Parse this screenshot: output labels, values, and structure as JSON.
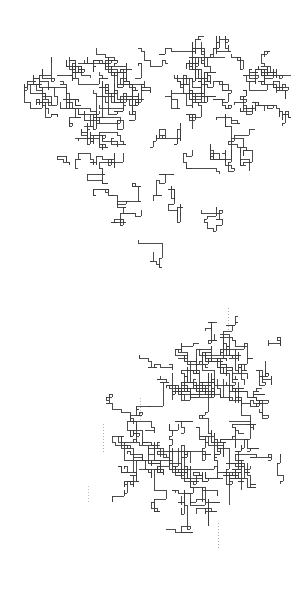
{
  "figure": {
    "title": "",
    "background_color": "#ffffff",
    "width": 298,
    "height": 607,
    "panel_count": 2
  },
  "chart_data": {
    "type": "scatter",
    "title": "",
    "subtitle": "",
    "xlabel": "",
    "ylabel": "",
    "grid": false,
    "legend": null,
    "panels": [
      {
        "id": "panel-top",
        "name": "upper-cluster",
        "x": 0,
        "y": 0,
        "width": 298,
        "height": 303,
        "stroke_color": "#3a3a3a",
        "stroke_width": 0.9,
        "lattice_spacing": 3,
        "bbox": [
          24,
          36,
          292,
          296
        ],
        "seed": 20240517,
        "segment_count": 2600,
        "morphology": "broad two-lobed mass: one lobe upper-left, one lobe upper-right, merging into a wide lower band that tapers to a point at lower-left and extends down the right edge",
        "density_centers": [
          {
            "cx": 88,
            "cy": 108,
            "r": 74,
            "weight": 1.0
          },
          {
            "cx": 220,
            "cy": 96,
            "r": 76,
            "weight": 1.0
          },
          {
            "cx": 168,
            "cy": 196,
            "r": 86,
            "weight": 0.95
          },
          {
            "cx": 250,
            "cy": 228,
            "r": 62,
            "weight": 0.85
          },
          {
            "cx": 96,
            "cy": 232,
            "r": 58,
            "weight": 0.7
          }
        ],
        "voids": [
          {
            "cx": 150,
            "cy": 118,
            "r": 30
          },
          {
            "cx": 112,
            "cy": 288,
            "r": 26
          },
          {
            "cx": 196,
            "cy": 276,
            "r": 22
          }
        ],
        "tendrils": []
      },
      {
        "id": "panel-bottom",
        "name": "lower-cluster",
        "x": 0,
        "y": 303,
        "width": 298,
        "height": 304,
        "stroke_color": "#3a3a3a",
        "stroke_width": 0.9,
        "lattice_spacing": 3,
        "bbox": [
          16,
          316,
          284,
          594
        ],
        "seed": 88130462,
        "segment_count": 2400,
        "morphology": "elongated cluster running diagonally from upper-right to lower-left, thickest through the middle, with a lower-left lobe and a dense upper-right lobe",
        "density_centers": [
          {
            "cx": 224,
            "cy": 360,
            "r": 66,
            "weight": 1.0
          },
          {
            "cx": 186,
            "cy": 452,
            "r": 78,
            "weight": 1.0
          },
          {
            "cx": 236,
            "cy": 470,
            "r": 62,
            "weight": 0.92
          },
          {
            "cx": 108,
            "cy": 498,
            "r": 62,
            "weight": 0.88
          },
          {
            "cx": 62,
            "cy": 540,
            "r": 44,
            "weight": 0.7
          },
          {
            "cx": 132,
            "cy": 418,
            "r": 44,
            "weight": 0.7
          }
        ],
        "voids": [
          {
            "cx": 270,
            "cy": 560,
            "r": 32
          },
          {
            "cx": 70,
            "cy": 400,
            "r": 40
          },
          {
            "cx": 250,
            "cy": 330,
            "r": 18
          }
        ],
        "tendrils": [
          {
            "x": 228,
            "y_from": 308,
            "y_to": 332,
            "orientation": "vertical",
            "style": "dotted",
            "color": "#9a9a9a"
          },
          {
            "x": 103,
            "y_from": 424,
            "y_to": 452,
            "orientation": "vertical",
            "style": "dotted",
            "color": "#9a9a9a"
          },
          {
            "x": 140,
            "y_from": 398,
            "y_to": 420,
            "orientation": "vertical",
            "style": "dotted",
            "color": "#a8a8a8"
          },
          {
            "x": 218,
            "y_from": 523,
            "y_to": 548,
            "orientation": "vertical",
            "style": "dotted",
            "color": "#9a9a9a"
          },
          {
            "x": 88,
            "y_from": 486,
            "y_to": 502,
            "orientation": "vertical",
            "style": "dotted",
            "color": "#aaaaaa"
          }
        ]
      }
    ],
    "colors": {
      "stroke": "#3a3a3a",
      "background": "#ffffff",
      "tendril": "#9a9a9a"
    }
  }
}
